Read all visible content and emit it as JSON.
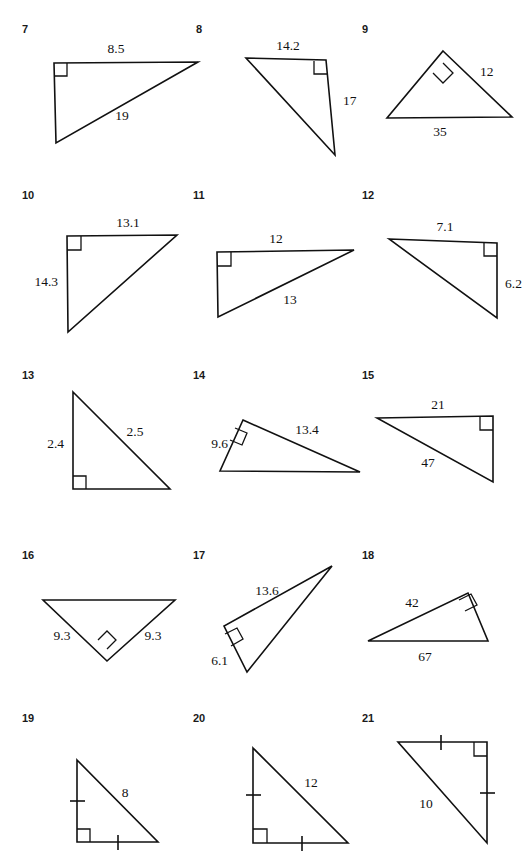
{
  "page": {
    "kind": "geometry-worksheet",
    "ink_color": "#111111",
    "background_color": "#ffffff",
    "columns": 3,
    "rows": 5
  },
  "problems": [
    {
      "number": "7",
      "num_pos": {
        "x": 22,
        "y": 33
      },
      "points": "54,63 198,62 56,143",
      "right_angle": {
        "type": "square",
        "points": "54,76 67,76 67,63"
      },
      "labels": [
        {
          "text": "8.5",
          "x": 116,
          "y": 53,
          "anchor": "middle"
        },
        {
          "text": "19",
          "x": 122,
          "y": 120,
          "anchor": "middle"
        }
      ],
      "ticks": []
    },
    {
      "number": "8",
      "num_pos": {
        "x": 196,
        "y": 33
      },
      "points": "246,58 326,60 335,155",
      "right_angle": {
        "type": "square",
        "points": "314,61 314,74 327,74"
      },
      "labels": [
        {
          "text": "14.2",
          "x": 288,
          "y": 50,
          "anchor": "middle"
        },
        {
          "text": "17",
          "x": 343,
          "y": 105,
          "anchor": "start"
        }
      ],
      "ticks": []
    },
    {
      "number": "9",
      "num_pos": {
        "x": 362,
        "y": 33
      },
      "points": "443,51 512,117 387,118",
      "right_angle": {
        "type": "diamond",
        "points": "443,63 453,73 443,83 433,73"
      },
      "labels": [
        {
          "text": "12",
          "x": 480,
          "y": 76,
          "anchor": "start"
        },
        {
          "text": "35",
          "x": 440,
          "y": 136,
          "anchor": "middle"
        }
      ],
      "ticks": []
    },
    {
      "number": "10",
      "num_pos": {
        "x": 22,
        "y": 199
      },
      "points": "67,236 177,235 68,332",
      "right_angle": {
        "type": "square",
        "points": "67,250 81,250 81,236"
      },
      "labels": [
        {
          "text": "13.1",
          "x": 128,
          "y": 227,
          "anchor": "middle"
        },
        {
          "text": "14.3",
          "x": 58,
          "y": 286,
          "anchor": "end"
        }
      ],
      "ticks": []
    },
    {
      "number": "11",
      "num_pos": {
        "x": 193,
        "y": 199
      },
      "points": "217,252 354,250 218,317",
      "right_angle": {
        "type": "square",
        "points": "217,266 231,266 231,252"
      },
      "labels": [
        {
          "text": "12",
          "x": 276,
          "y": 243,
          "anchor": "middle"
        },
        {
          "text": "13",
          "x": 290,
          "y": 304,
          "anchor": "middle"
        }
      ],
      "ticks": []
    },
    {
      "number": "12",
      "num_pos": {
        "x": 362,
        "y": 199
      },
      "points": "389,239 497,243 497,318",
      "right_angle": {
        "type": "square",
        "points": "484,242 484,256 497,256"
      },
      "labels": [
        {
          "text": "7.1",
          "x": 445,
          "y": 231,
          "anchor": "middle"
        },
        {
          "text": "6.2",
          "x": 505,
          "y": 288,
          "anchor": "start"
        }
      ],
      "ticks": []
    },
    {
      "number": "13",
      "num_pos": {
        "x": 22,
        "y": 379
      },
      "points": "73,392 170,489 73,489",
      "right_angle": {
        "type": "square",
        "points": "73,476 86,476 86,489"
      },
      "labels": [
        {
          "text": "2.5",
          "x": 135,
          "y": 436,
          "anchor": "middle"
        },
        {
          "text": "2.4",
          "x": 64,
          "y": 448,
          "anchor": "end"
        }
      ],
      "ticks": []
    },
    {
      "number": "14",
      "num_pos": {
        "x": 193,
        "y": 379
      },
      "points": "243,420 360,472 220,471",
      "right_angle": {
        "type": "rotated",
        "points": "235,428 247,433 242,445 230,440"
      },
      "labels": [
        {
          "text": "13.4",
          "x": 307,
          "y": 434,
          "anchor": "middle"
        },
        {
          "text": "9.6",
          "x": 228,
          "y": 448,
          "anchor": "end"
        }
      ],
      "ticks": []
    },
    {
      "number": "15",
      "num_pos": {
        "x": 362,
        "y": 379
      },
      "points": "377,418 493,416 493,482",
      "right_angle": {
        "type": "square",
        "points": "480,416 480,430 493,430"
      },
      "labels": [
        {
          "text": "21",
          "x": 438,
          "y": 409,
          "anchor": "middle"
        },
        {
          "text": "47",
          "x": 428,
          "y": 467,
          "anchor": "middle"
        }
      ],
      "ticks": []
    },
    {
      "number": "16",
      "num_pos": {
        "x": 22,
        "y": 559
      },
      "points": "43,600 175,600 107,661",
      "right_angle": {
        "type": "diamond",
        "points": "107,649 116,640 107,631 98,640"
      },
      "labels": [
        {
          "text": "9.3",
          "x": 62,
          "y": 640,
          "anchor": "middle"
        },
        {
          "text": "9.3",
          "x": 153,
          "y": 640,
          "anchor": "middle"
        }
      ],
      "ticks": []
    },
    {
      "number": "17",
      "num_pos": {
        "x": 193,
        "y": 559
      },
      "points": "332,566 224,626 247,672",
      "right_angle": {
        "type": "rotated",
        "points": "225,634 237,628 243,639 231,646"
      },
      "labels": [
        {
          "text": "13.6",
          "x": 267,
          "y": 595,
          "anchor": "middle"
        },
        {
          "text": "6.1",
          "x": 228,
          "y": 665,
          "anchor": "end"
        }
      ],
      "ticks": []
    },
    {
      "number": "18",
      "num_pos": {
        "x": 362,
        "y": 559
      },
      "points": "368,641 468,593 488,641",
      "right_angle": {
        "type": "rotated",
        "points": "459,600 471,594 477,605 465,611"
      },
      "labels": [
        {
          "text": "42",
          "x": 412,
          "y": 607,
          "anchor": "middle"
        },
        {
          "text": "67",
          "x": 425,
          "y": 661,
          "anchor": "middle"
        }
      ],
      "ticks": []
    },
    {
      "number": "19",
      "num_pos": {
        "x": 22,
        "y": 722
      },
      "points": "77,760 158,842 77,842",
      "right_angle": {
        "type": "square",
        "points": "77,829 90,829 90,842"
      },
      "labels": [
        {
          "text": "8",
          "x": 125,
          "y": 797,
          "anchor": "middle"
        }
      ],
      "ticks": [
        {
          "x1": 70,
          "y1": 801,
          "x2": 85,
          "y2": 801
        },
        {
          "x1": 118,
          "y1": 835,
          "x2": 118,
          "y2": 850
        }
      ]
    },
    {
      "number": "20",
      "num_pos": {
        "x": 193,
        "y": 722
      },
      "points": "253,748 348,843 253,843",
      "right_angle": {
        "type": "square",
        "points": "253,829 267,829 267,843"
      },
      "labels": [
        {
          "text": "12",
          "x": 311,
          "y": 787,
          "anchor": "middle"
        }
      ],
      "ticks": [
        {
          "x1": 246,
          "y1": 795,
          "x2": 261,
          "y2": 795
        },
        {
          "x1": 302,
          "y1": 836,
          "x2": 302,
          "y2": 851
        }
      ]
    },
    {
      "number": "21",
      "num_pos": {
        "x": 362,
        "y": 722
      },
      "points": "398,742 487,742 487,843",
      "right_angle": {
        "type": "square",
        "points": "474,742 474,756 487,756"
      },
      "labels": [
        {
          "text": "10",
          "x": 426,
          "y": 808,
          "anchor": "middle"
        }
      ],
      "ticks": [
        {
          "x1": 441,
          "y1": 735,
          "x2": 441,
          "y2": 750
        },
        {
          "x1": 480,
          "y1": 793,
          "x2": 495,
          "y2": 793
        }
      ]
    }
  ]
}
